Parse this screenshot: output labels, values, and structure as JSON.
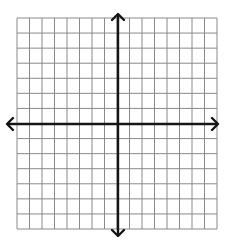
{
  "diagram": {
    "type": "coordinate-plane",
    "grid": {
      "columns": 16,
      "rows": 14,
      "left": 17,
      "top": 18,
      "right": 217,
      "bottom": 229,
      "line_color": "#8a8a8a"
    },
    "axes": {
      "x_axis_y": 124,
      "y_axis_x": 118,
      "x_extent": [
        7,
        218
      ],
      "y_extent": [
        14,
        236
      ],
      "color": "#151515",
      "arrows": [
        "left",
        "right",
        "up",
        "down"
      ],
      "labels": []
    },
    "background": "#ffffff"
  }
}
